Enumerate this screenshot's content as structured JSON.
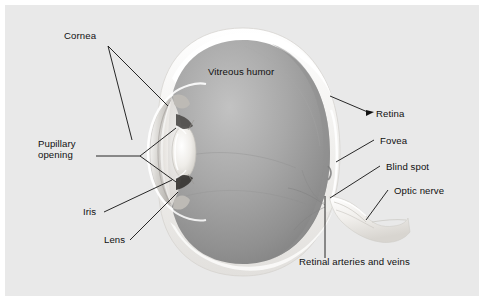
{
  "figure": {
    "panel_background": "#e9e9e9",
    "page_background": "#ffffff",
    "label_color": "#101010",
    "leader_color": "#111111"
  },
  "anatomy": {
    "sclera_color": "#f4f3f1",
    "vitreous_color_light": "#b9b9b9",
    "vitreous_color_mid": "#9a9a9a",
    "vitreous_color_dark": "#7e7e7e",
    "cornea_color": "#d6d4d1",
    "lens_color": "#f0eeea",
    "iris_color": "#4a4a4a",
    "optic_nerve_color": "#f2f1ee",
    "parts": [
      {
        "id": "sclera",
        "name": "Sclera"
      },
      {
        "id": "cornea",
        "name": "Cornea"
      },
      {
        "id": "iris",
        "name": "Iris"
      },
      {
        "id": "lens",
        "name": "Lens"
      },
      {
        "id": "vitreous",
        "name": "Vitreous humor"
      },
      {
        "id": "retina",
        "name": "Retina"
      },
      {
        "id": "fovea",
        "name": "Fovea"
      },
      {
        "id": "blind-spot",
        "name": "Blind spot"
      },
      {
        "id": "optic-nerve",
        "name": "Optic nerve"
      },
      {
        "id": "retinal-vessels",
        "name": "Retinal arteries and veins"
      },
      {
        "id": "pupillary-opening",
        "name": "Pupillary opening"
      }
    ]
  },
  "labels": {
    "cornea": "Cornea",
    "pupillary_opening_line1": "Pupillary",
    "pupillary_opening_line2": "opening",
    "iris": "Iris",
    "lens": "Lens",
    "vitreous_humor": "Vitreous humor",
    "retina": "Retina",
    "fovea": "Fovea",
    "blind_spot": "Blind spot",
    "optic_nerve": "Optic nerve",
    "retinal_arteries_and_veins": "Retinal arteries and veins"
  }
}
